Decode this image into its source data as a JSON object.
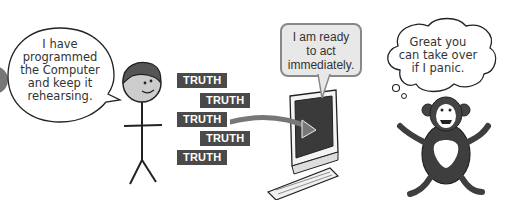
{
  "scene": {
    "person": {
      "speech_lines": [
        "I have",
        "programmed",
        "the Computer",
        "and keep it",
        "rehearsing."
      ]
    },
    "truth_labels": [
      "TRUTH",
      "TRUTH",
      "TRUTH",
      "TRUTH",
      "TRUTH"
    ],
    "computer": {
      "speech_lines": [
        "I am ready",
        "to act",
        "immediately."
      ]
    },
    "chimp": {
      "thought_lines": [
        "Great you",
        "can take over",
        "if I panic."
      ]
    },
    "colors": {
      "truth_bg": "#4a4a4a",
      "screen": "#3a3a3a",
      "bubble_fill": "#e8e8e8"
    }
  }
}
